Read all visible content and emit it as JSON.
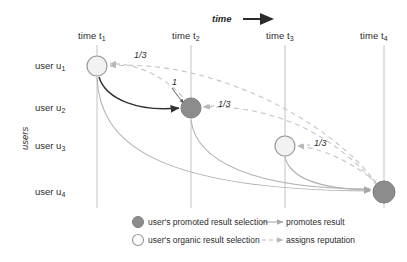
{
  "figure": {
    "axis_time_label": "time",
    "axis_users_label": "users"
  },
  "colors": {
    "promoted_fill": "#8c8c8c",
    "organic_fill": "#f2f2f2",
    "node_stroke": "#999999",
    "timeline": "#c9c9c9",
    "promote_edge": "#b3b3b3",
    "promote_edge_dark": "#333333",
    "reputation_edge": "#c4c4c4",
    "text": "#2b2b2b"
  },
  "timeline": {
    "columns": [
      {
        "id": "t1",
        "label": "time t",
        "sub": "1",
        "x": 97
      },
      {
        "id": "t2",
        "label": "time t",
        "sub": "2",
        "x": 191
      },
      {
        "id": "t3",
        "label": "time t",
        "sub": "3",
        "x": 285
      },
      {
        "id": "t4",
        "label": "time t",
        "sub": "4",
        "x": 384
      }
    ]
  },
  "users": {
    "rows": [
      {
        "id": "u1",
        "label": "user u",
        "sub": "1",
        "y": 66
      },
      {
        "id": "u2",
        "label": "user u",
        "sub": "2",
        "y": 108
      },
      {
        "id": "u3",
        "label": "user u",
        "sub": "3",
        "y": 146
      },
      {
        "id": "u4",
        "label": "user u",
        "sub": "4",
        "y": 192
      }
    ]
  },
  "nodes": [
    {
      "id": "n-u1-t1",
      "user": "u1",
      "time": "t1",
      "x": 97,
      "y": 66,
      "r": 10,
      "kind": "organic"
    },
    {
      "id": "n-u2-t2",
      "user": "u2",
      "time": "t2",
      "x": 191,
      "y": 108,
      "r": 10,
      "kind": "promoted"
    },
    {
      "id": "n-u3-t3",
      "user": "u3",
      "time": "t3",
      "x": 285,
      "y": 146,
      "r": 10,
      "kind": "organic"
    },
    {
      "id": "n-u4-t4",
      "user": "u4",
      "time": "t4",
      "x": 384,
      "y": 192,
      "r": 11,
      "kind": "promoted"
    }
  ],
  "weight_labels": [
    {
      "id": "w-t2-u1",
      "text": "1/3",
      "x": 134,
      "y": 56
    },
    {
      "id": "w-u1-u2",
      "text": "1",
      "x": 172,
      "y": 83
    },
    {
      "id": "w-t4-u2",
      "text": "1/3",
      "x": 218,
      "y": 102
    },
    {
      "id": "w-t4-u3",
      "text": "1/3",
      "x": 314,
      "y": 141
    }
  ],
  "legend": {
    "items": [
      {
        "id": "legend-promoted",
        "marker": "filled-circle-icon",
        "text": "user's promoted result selection"
      },
      {
        "id": "legend-organic",
        "marker": "open-circle-icon",
        "text": "user's organic result selection"
      },
      {
        "id": "legend-promotes",
        "marker": "solid-arrow-icon",
        "text": "promotes result"
      },
      {
        "id": "legend-reputation",
        "marker": "dashed-arrow-icon",
        "text": "assigns reputation"
      }
    ]
  }
}
